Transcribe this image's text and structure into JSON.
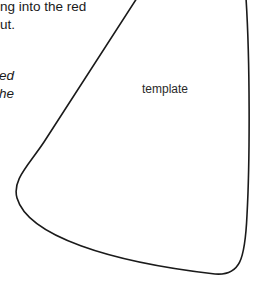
{
  "body_text": {
    "line1": "ng into the red",
    "line2": "ut.",
    "italic_line1": "ed",
    "italic_line2": "he"
  },
  "shape": {
    "label": "template",
    "stroke": "#1a1a1a"
  }
}
